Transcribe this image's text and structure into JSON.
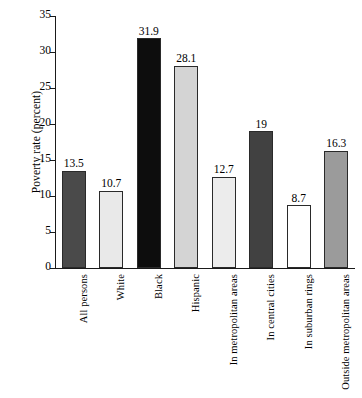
{
  "chart_data": {
    "type": "bar",
    "title": "",
    "xlabel": "",
    "ylabel": "Poverty rate (percent)",
    "ylim": [
      0,
      35
    ],
    "yticks": [
      0,
      5,
      10,
      15,
      20,
      25,
      30,
      35
    ],
    "grid": false,
    "legend": "none",
    "categories": [
      "All persons",
      "White",
      "Black",
      "Hispanic",
      "In metropolitan areas",
      "In central cities",
      "In suburban rings",
      "Outside metropolitan areas"
    ],
    "values": [
      13.5,
      10.7,
      31.9,
      28.1,
      12.7,
      19,
      8.7,
      16.3
    ],
    "value_labels": [
      "13.5",
      "10.7",
      "31.9",
      "28.1",
      "12.7",
      "19",
      "8.7",
      "16.3"
    ],
    "bar_colors": [
      "#4a4a4a",
      "#e9e9e9",
      "#0d0d0d",
      "#d4d4d4",
      "#ececec",
      "#414141",
      "#ffffff",
      "#9b9b9b"
    ],
    "axis_color": "#1a1a1a",
    "background": "#ffffff"
  },
  "yticks_text": [
    "0",
    "5",
    "10",
    "15",
    "20",
    "25",
    "30",
    "35"
  ]
}
